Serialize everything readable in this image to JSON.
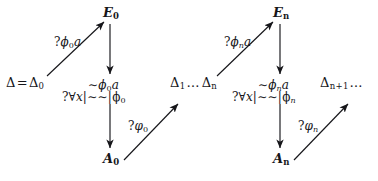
{
  "figure": {
    "kind": "commutative-diagram"
  },
  "left": {
    "start_node": {
      "base": "Δ",
      "eq": "=",
      "base2": "Δ",
      "sub": "0"
    },
    "top_node": {
      "base": "E",
      "sub": "0"
    },
    "bottom_node": {
      "base": "A",
      "sub": "0"
    },
    "up_edge_label": {
      "q": "?",
      "sym": "ϕ",
      "sub": "0",
      "arg": "a"
    },
    "down_edge_label": {
      "neg": "∼",
      "sym": "ϕ",
      "sub": "0",
      "arg": "a"
    },
    "formula_label": {
      "q": "?",
      "forall": "∀",
      "var": "x",
      "bar": "|",
      "neg": "∼∼",
      "bar2": "|",
      "sym": "ϕ",
      "sub": "0"
    },
    "out_edge_label": {
      "q": "?",
      "sym": "φ",
      "sub": "0"
    }
  },
  "middle": {
    "seq": {
      "base": "Δ",
      "sub": "1",
      "dots": "…",
      "base2": "Δ",
      "sub2": "n"
    }
  },
  "right": {
    "start_node": {
      "dots": "…",
      "base": "Δ",
      "sub": "n"
    },
    "top_node": {
      "base": "E",
      "sub": "n"
    },
    "bottom_node": {
      "base": "A",
      "sub": "n"
    },
    "up_edge_label": {
      "q": "?",
      "sym": "ϕ",
      "sub": "n",
      "arg": "a"
    },
    "down_edge_label": {
      "neg": "∼",
      "sym": "ϕ",
      "sub": "n",
      "arg": "a"
    },
    "formula_label": {
      "q": "?",
      "forall": "∀",
      "var": "x",
      "bar": "|",
      "neg": "∼∼",
      "bar2": "|",
      "sym": "ϕ",
      "sub": "n"
    },
    "out_edge_label": {
      "q": "?",
      "sym": "φ",
      "sub": "n"
    }
  },
  "tail": {
    "seq": {
      "base": "Δ",
      "sub": "n+1",
      "dots": "…"
    }
  },
  "colors": {
    "ink": "#16161a",
    "background": "#ffffff"
  }
}
